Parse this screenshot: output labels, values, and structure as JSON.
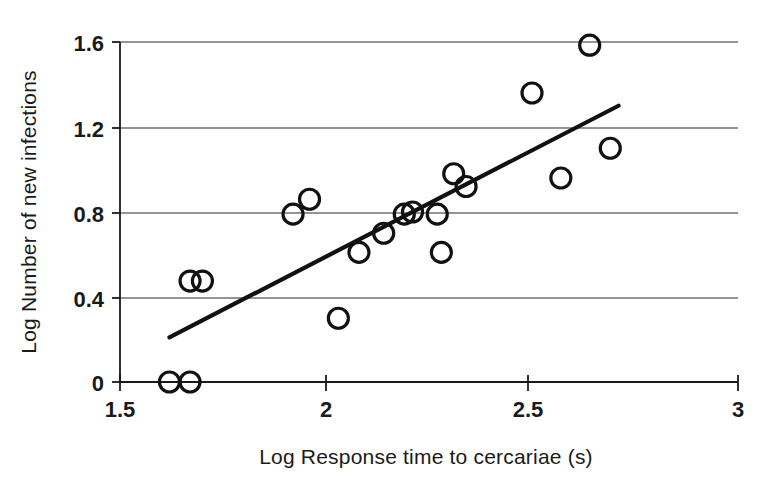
{
  "chart_data": {
    "type": "scatter",
    "title": "",
    "xlabel": "Log Response time to cercariae (s)",
    "ylabel": "Log Number of new infections",
    "xlim": [
      1.5,
      3.0
    ],
    "ylim": [
      0.0,
      1.6
    ],
    "xticks": [
      "1.5",
      "2",
      "2.5",
      "3"
    ],
    "xtick_values": [
      1.5,
      2.0,
      2.5,
      3.0
    ],
    "yticks": [
      "0",
      "0.4",
      "0.8",
      "1.2",
      "1.6"
    ],
    "ytick_values": [
      0,
      0.4,
      0.8,
      1.2,
      1.6
    ],
    "grid": "horizontal",
    "legend": "none",
    "marker": "open-circle",
    "points": [
      {
        "x": 1.62,
        "y": 0.0
      },
      {
        "x": 1.67,
        "y": 0.0
      },
      {
        "x": 1.67,
        "y": 0.475
      },
      {
        "x": 1.7,
        "y": 0.475
      },
      {
        "x": 1.92,
        "y": 0.79
      },
      {
        "x": 1.96,
        "y": 0.86
      },
      {
        "x": 2.03,
        "y": 0.3
      },
      {
        "x": 2.08,
        "y": 0.61
      },
      {
        "x": 2.14,
        "y": 0.7
      },
      {
        "x": 2.19,
        "y": 0.79
      },
      {
        "x": 2.21,
        "y": 0.8
      },
      {
        "x": 2.27,
        "y": 0.79
      },
      {
        "x": 2.28,
        "y": 0.61
      },
      {
        "x": 2.31,
        "y": 0.98
      },
      {
        "x": 2.34,
        "y": 0.92
      },
      {
        "x": 2.5,
        "y": 1.36
      },
      {
        "x": 2.57,
        "y": 0.96
      },
      {
        "x": 2.64,
        "y": 1.585
      },
      {
        "x": 2.69,
        "y": 1.1
      }
    ],
    "trendline": {
      "name": "regression-line",
      "x_start": 1.62,
      "y_start": 0.21,
      "x_end": 2.71,
      "y_end": 1.3
    },
    "colors": {
      "axis": "#1a1a1a",
      "grid": "#2b2b2b",
      "marker": "#111111",
      "trendline": "#111111",
      "background": "#ffffff"
    }
  }
}
